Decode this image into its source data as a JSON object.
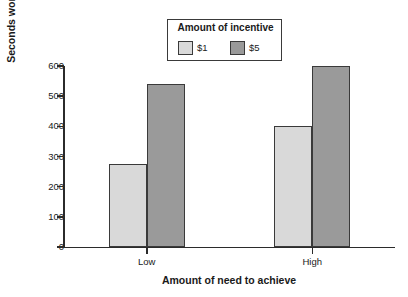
{
  "chart_data": {
    "type": "bar",
    "title": "",
    "xlabel": "Amount of need to achieve",
    "ylabel": "Seconds worked on anagrams",
    "categories": [
      "Low",
      "High"
    ],
    "series": [
      {
        "name": "$1",
        "values": [
          275,
          400
        ],
        "color": "#d9d9d9"
      },
      {
        "name": "$5",
        "values": [
          540,
          600
        ],
        "color": "#9a9a9a"
      }
    ],
    "ylim": [
      0,
      600
    ],
    "yticks": [
      0,
      100,
      200,
      300,
      400,
      500,
      600
    ],
    "ytick_labels": [
      "0",
      "100",
      "200",
      "300",
      "400",
      "500",
      "600"
    ],
    "grid": false,
    "legend": {
      "title": "Amount of incentive",
      "position": "top-center",
      "entries": [
        "$1",
        "$5"
      ]
    }
  },
  "axes": {
    "y_title": "Seconds worked on anagrams",
    "x_title": "Amount of need to achieve"
  },
  "colors": {
    "bar_light": "#d9d9d9",
    "bar_dark": "#9a9a9a",
    "bar_border": "#3a3a3a",
    "axis": "#2b2b2b",
    "text": "#1a1a1a",
    "background": "#ffffff"
  }
}
